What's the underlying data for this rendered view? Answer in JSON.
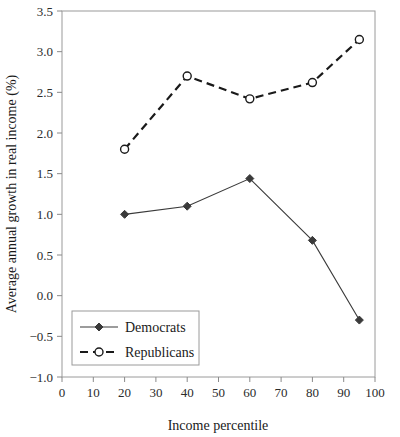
{
  "chart_data": {
    "type": "line",
    "title": "",
    "xlabel": "Income percentile",
    "ylabel": "Average annual growth in real income (%)",
    "x": [
      20,
      40,
      60,
      80,
      95
    ],
    "xlim": [
      0,
      100
    ],
    "ylim": [
      -1.0,
      3.5
    ],
    "xticks": [
      "0",
      "10",
      "20",
      "30",
      "40",
      "50",
      "60",
      "70",
      "80",
      "90",
      "100"
    ],
    "xtick_values": [
      0,
      10,
      20,
      30,
      40,
      50,
      60,
      70,
      80,
      90,
      100
    ],
    "yticks": [
      "−1.0",
      "−0.5",
      "0.0",
      "0.5",
      "1.0",
      "1.5",
      "2.0",
      "2.5",
      "3.0",
      "3.5"
    ],
    "ytick_values": [
      -1.0,
      -0.5,
      0.0,
      0.5,
      1.0,
      1.5,
      2.0,
      2.5,
      3.0,
      3.5
    ],
    "grid": false,
    "legend_position": "lower-left-inside",
    "series": [
      {
        "name": "Democrats",
        "values": [
          1.0,
          1.1,
          1.44,
          0.68,
          -0.3
        ],
        "line_style": "solid",
        "marker": "filled-diamond",
        "color": "#3a3a3a"
      },
      {
        "name": "Republicans",
        "values": [
          1.8,
          2.7,
          2.42,
          2.62,
          3.15
        ],
        "line_style": "dashed",
        "marker": "open-circle",
        "color": "#1a1a1a"
      }
    ]
  },
  "legend": {
    "items": [
      {
        "label": "Democrats"
      },
      {
        "label": "Republicans"
      }
    ]
  },
  "colors": {
    "axis": "#8a8a8a",
    "democrats": "#3a3a3a",
    "republicans": "#1a1a1a",
    "text": "#1a1a1a",
    "background": "#ffffff"
  }
}
